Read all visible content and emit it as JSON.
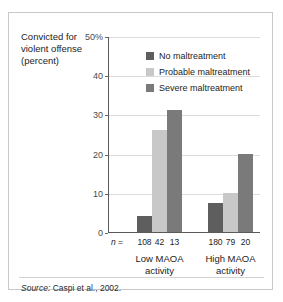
{
  "figure": {
    "y_axis_title": [
      "Convicted for",
      "violent offense",
      "(percent)"
    ],
    "source_prefix": "Source:",
    "source_text": "Caspi et al., 2002.",
    "n_prefix_italic": "n",
    "n_prefix_rest": " ="
  },
  "chart_data": {
    "type": "bar",
    "title": "",
    "xlabel": "",
    "ylabel": "Convicted for violent offense (percent)",
    "categories": [
      "Low MAOA activity",
      "High MAOA activity"
    ],
    "category_lines": [
      [
        "Low MAOA",
        "activity"
      ],
      [
        "High MAOA",
        "activity"
      ]
    ],
    "series": [
      {
        "name": "No maltreatment",
        "values": [
          4,
          7.5
        ],
        "color": "#5e5e5e"
      },
      {
        "name": "Probable maltreatment",
        "values": [
          26,
          10
        ],
        "color": "#c8c8c8"
      },
      {
        "name": "Severe maltreatment",
        "values": [
          31,
          20
        ],
        "color": "#7a7a7a"
      }
    ],
    "sample_sizes": [
      [
        108,
        42,
        13
      ],
      [
        180,
        79,
        20
      ]
    ],
    "ylim": [
      0,
      50
    ],
    "yticks": [
      0,
      10,
      20,
      30,
      40,
      50
    ],
    "ytick_labels": [
      "0",
      "10",
      "20",
      "30",
      "40",
      "50%"
    ],
    "grid": true,
    "legend_position": "inside-top-right"
  },
  "colors": {
    "frame": "#c9c9c9",
    "axis": "#5a5a5a",
    "gridline": "#dcdcdc",
    "text": "#1d1d1d"
  }
}
